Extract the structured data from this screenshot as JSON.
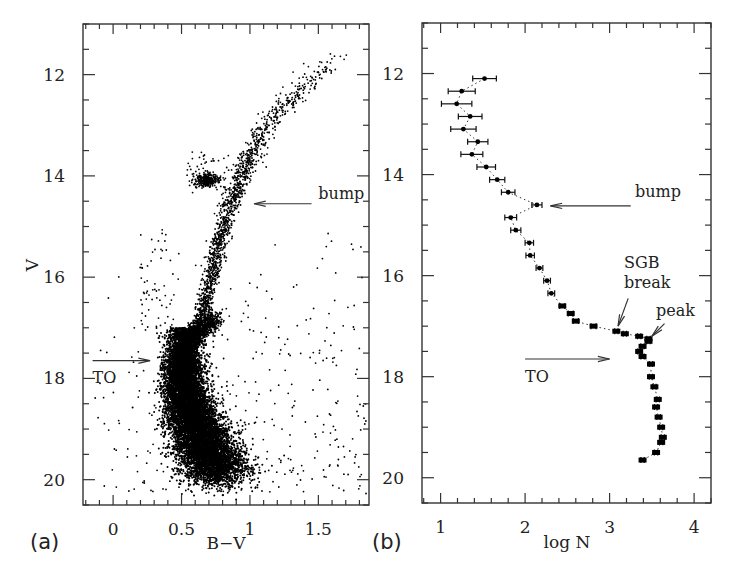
{
  "figure": {
    "panel_a_label": "(a)",
    "panel_b_label": "(b)"
  },
  "chart_data": [
    {
      "type": "scatter",
      "title": "Colour-magnitude diagram",
      "panel": "(a)",
      "xlabel": "B−V",
      "ylabel": "V",
      "xlim": [
        -0.22,
        1.87
      ],
      "ylim": [
        20.5,
        11.0
      ],
      "y_inverted": true,
      "grid": false,
      "x_ticks_major": [
        0,
        0.5,
        1,
        1.5
      ],
      "x_tick_labels": [
        "0",
        "0.5",
        "1",
        "1.5"
      ],
      "x_minor_step": 0.1,
      "y_ticks_major": [
        12,
        14,
        16,
        18,
        20
      ],
      "y_tick_labels": [
        "12",
        "14",
        "16",
        "18",
        "20"
      ],
      "y_minor_step": 0.5,
      "annotations": [
        {
          "text": "bump",
          "text_x": 1.5,
          "text_y": 14.45,
          "arrow_from": [
            1.45,
            14.55
          ],
          "arrow_to": [
            1.03,
            14.55
          ]
        },
        {
          "text": "TO",
          "text_x": -0.15,
          "text_y": 18.1,
          "arrow_from": [
            -0.15,
            17.65
          ],
          "arrow_to": [
            0.27,
            17.65
          ]
        }
      ],
      "features": [
        {
          "name": "red giant branch",
          "path_bv_v": [
            [
              0.58,
              17.2
            ],
            [
              0.66,
              16.6
            ],
            [
              0.72,
              16.0
            ],
            [
              0.77,
              15.4
            ],
            [
              0.82,
              14.9
            ],
            [
              0.88,
              14.4
            ],
            [
              0.95,
              13.9
            ],
            [
              1.02,
              13.5
            ],
            [
              1.13,
              13.0
            ],
            [
              1.3,
              12.5
            ],
            [
              1.45,
              12.1
            ],
            [
              1.63,
              11.7
            ]
          ],
          "scatter": 0.025
        },
        {
          "name": "red clump / horizontal branch",
          "center_bv_v": [
            0.68,
            14.08
          ],
          "spread_bv_v": [
            0.05,
            0.07
          ]
        },
        {
          "name": "RGB bump",
          "center_bv_v": [
            0.9,
            14.6
          ]
        },
        {
          "name": "subgiant branch",
          "path_bv_v": [
            [
              0.5,
              17.6
            ],
            [
              0.55,
              17.3
            ],
            [
              0.62,
              17.1
            ],
            [
              0.7,
              16.95
            ],
            [
              0.74,
              16.8
            ]
          ]
        },
        {
          "name": "main-sequence turnoff",
          "center_bv_v": [
            0.5,
            17.65
          ]
        },
        {
          "name": "main sequence",
          "path_bv_v": [
            [
              0.5,
              17.6
            ],
            [
              0.52,
              18.2
            ],
            [
              0.57,
              18.7
            ],
            [
              0.63,
              19.1
            ],
            [
              0.7,
              19.5
            ],
            [
              0.78,
              19.9
            ]
          ],
          "width": 0.12
        },
        {
          "name": "field contamination",
          "bv_range": [
            -0.15,
            1.85
          ],
          "v_range": [
            15.0,
            20.3
          ]
        }
      ]
    },
    {
      "type": "line",
      "title": "Luminosity function",
      "panel": "(b)",
      "xlabel": "log N",
      "ylabel": "",
      "xlim": [
        0.78,
        4.2
      ],
      "ylim": [
        20.5,
        11.0
      ],
      "y_inverted": true,
      "grid": false,
      "line_style": "dotted with error bars",
      "x_ticks_major": [
        1,
        2,
        3,
        4
      ],
      "x_tick_labels": [
        "1",
        "2",
        "3",
        "4"
      ],
      "x_minor_step": 0.2,
      "y_ticks_major": [
        12,
        14,
        16,
        18,
        20
      ],
      "y_tick_labels": [
        "12",
        "14",
        "16",
        "18",
        "20"
      ],
      "y_minor_step": 0.5,
      "series": [
        {
          "name": "LF",
          "V": [
            12.1,
            12.35,
            12.6,
            12.85,
            13.1,
            13.35,
            13.6,
            13.85,
            14.1,
            14.35,
            14.6,
            14.85,
            15.1,
            15.35,
            15.6,
            15.85,
            16.1,
            16.35,
            16.6,
            16.75,
            16.9,
            17.0,
            17.1,
            17.15,
            17.2,
            17.25,
            17.3,
            17.4,
            17.5,
            17.6,
            17.75,
            18.0,
            18.2,
            18.45,
            18.6,
            18.8,
            19.0,
            19.2,
            19.3,
            19.5,
            19.65
          ],
          "logN": [
            1.52,
            1.25,
            1.19,
            1.35,
            1.27,
            1.44,
            1.37,
            1.54,
            1.67,
            1.8,
            2.14,
            1.83,
            1.89,
            2.05,
            2.06,
            2.17,
            2.26,
            2.31,
            2.44,
            2.54,
            2.6,
            2.81,
            3.08,
            3.18,
            3.35,
            3.46,
            3.46,
            3.39,
            3.35,
            3.39,
            3.49,
            3.49,
            3.53,
            3.57,
            3.55,
            3.58,
            3.61,
            3.63,
            3.61,
            3.55,
            3.39
          ],
          "err": [
            0.14,
            0.16,
            0.18,
            0.14,
            0.15,
            0.12,
            0.13,
            0.11,
            0.09,
            0.08,
            0.06,
            0.07,
            0.06,
            0.05,
            0.05,
            0.04,
            0.04,
            0.04,
            0.03,
            0.03,
            0.03,
            0.03,
            0.02,
            0.02,
            0.02,
            0.02,
            0.02,
            0.02,
            0.02,
            0.02,
            0.02,
            0.02,
            0.02,
            0.02,
            0.02,
            0.02,
            0.02,
            0.02,
            0.02,
            0.02,
            0.02
          ]
        }
      ],
      "annotations": [
        {
          "text": "bump",
          "text_x": 3.3,
          "text_y": 14.45,
          "arrow_from": [
            3.25,
            14.62
          ],
          "arrow_to": [
            2.3,
            14.62
          ]
        },
        {
          "text": "SGB",
          "text_x": 3.17,
          "text_y": 15.85
        },
        {
          "text": "break",
          "text_x": 3.17,
          "text_y": 16.25
        },
        {
          "arrow_from": [
            3.22,
            16.45
          ],
          "arrow_to": [
            3.1,
            17.0
          ]
        },
        {
          "text": "peak",
          "text_x": 3.55,
          "text_y": 16.8
        },
        {
          "arrow_from": [
            3.65,
            16.95
          ],
          "arrow_to": [
            3.5,
            17.2
          ]
        },
        {
          "text": "TO",
          "text_x": 2.0,
          "text_y": 18.1,
          "arrow_from": [
            2.0,
            17.65
          ],
          "arrow_to": [
            3.0,
            17.65
          ]
        }
      ]
    }
  ]
}
